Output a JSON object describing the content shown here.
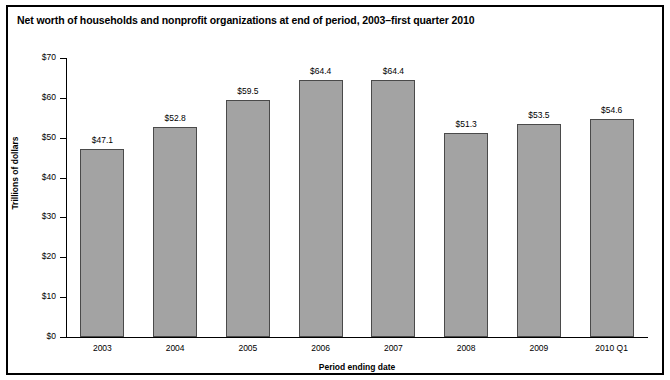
{
  "chart_data": {
    "type": "bar",
    "title": "Net worth of households and nonprofit organizations at end of period, 2003–first quarter 2010",
    "xlabel": "Period ending date",
    "ylabel": "Trillions of dollars",
    "categories": [
      "2003",
      "2004",
      "2005",
      "2006",
      "2007",
      "2008",
      "2009",
      "2010 Q1"
    ],
    "values": [
      47.1,
      52.8,
      59.5,
      64.4,
      64.4,
      51.3,
      53.5,
      54.6
    ],
    "value_labels": [
      "$47.1",
      "$52.8",
      "$59.5",
      "$64.4",
      "$64.4",
      "$51.3",
      "$53.5",
      "$54.6"
    ],
    "ylim": [
      0,
      70
    ],
    "ytick_values": [
      0,
      10,
      20,
      30,
      40,
      50,
      60,
      70
    ],
    "ytick_labels": [
      "$0",
      "$10",
      "$20",
      "$30",
      "$40",
      "$50",
      "$60",
      "$70"
    ],
    "grid": false,
    "legend": "none",
    "bar_fill_color": "#a3a3a3",
    "bar_border_color": "#4a4a4a",
    "axis_color": "#000000",
    "background_color": "#ffffff"
  }
}
